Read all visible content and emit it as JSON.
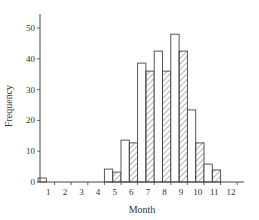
{
  "chart_data": {
    "type": "bar",
    "title": "",
    "xlabel": "Month",
    "ylabel": "Frequency",
    "categories": [
      "1",
      "2",
      "3",
      "4",
      "5",
      "6",
      "7",
      "8",
      "9",
      "10",
      "11",
      "12"
    ],
    "series": [
      {
        "name": "Series A (open bars)",
        "style": "open",
        "values": [
          1.3,
          0,
          0,
          0,
          4.2,
          13.6,
          38.6,
          42.5,
          48,
          23.4,
          5.8,
          0
        ]
      },
      {
        "name": "Series B (hatched bars)",
        "style": "hatched",
        "values": [
          0,
          0,
          0,
          0,
          3.2,
          12.7,
          36,
          36,
          42.5,
          12.7,
          3.9,
          0
        ]
      }
    ],
    "ylim": [
      0,
      55
    ],
    "yticks": [
      0,
      10,
      20,
      30,
      40,
      50
    ],
    "grid": false,
    "legend": "none"
  },
  "colors": {
    "axis": "#444444",
    "bar_stroke": "#444444",
    "bar_fill": "#ffffff",
    "hatch": "#555555"
  }
}
